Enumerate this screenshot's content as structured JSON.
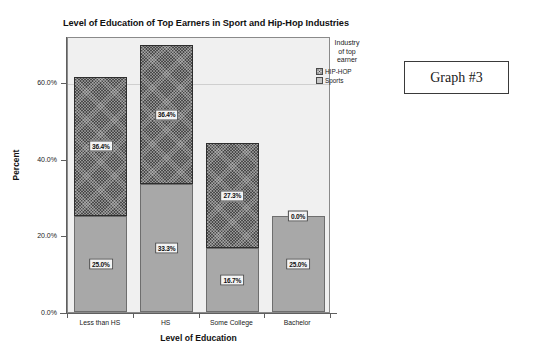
{
  "chart_data": {
    "type": "bar",
    "subtype": "stacked-bar",
    "title": "Level of Education of Top Earners in Sport and Hip-Hop Industries",
    "xlabel": "Level of Education",
    "ylabel": "Percent",
    "categories": [
      "Less than HS",
      "HS",
      "Some College",
      "Bachelor"
    ],
    "series": [
      {
        "name": "Sports",
        "values": [
          25.0,
          33.3,
          16.7,
          25.0
        ],
        "labels": [
          "25.0%",
          "33.3%",
          "16.7%",
          "25.0%"
        ],
        "color": "#a8a8a8"
      },
      {
        "name": "HIP-HOP",
        "values": [
          36.4,
          36.4,
          27.3,
          0.0
        ],
        "labels": [
          "36.4%",
          "36.4%",
          "27.3%",
          "0.0%"
        ],
        "color": "#4a4a4a"
      }
    ],
    "totals": [
      61.4,
      69.7,
      44.0,
      25.0
    ],
    "ylim": [
      0,
      72
    ],
    "ytick_values": [
      0.0,
      20.0,
      40.0,
      60.0
    ],
    "ytick_labels": [
      "0.0%",
      "20.0%",
      "40.0%",
      "60.0%"
    ],
    "grid": true,
    "gridline_at": 60.0,
    "legend_position": "right-top"
  },
  "legend": {
    "title_line1": "Industry",
    "title_line2": "of top",
    "title_line3": "earner",
    "entries": [
      {
        "label": "HIP-HOP",
        "swatch": "hiphop-swatch"
      },
      {
        "label": "Sports",
        "swatch": "sports-swatch"
      }
    ]
  },
  "annotation": {
    "label": "Graph #3"
  }
}
